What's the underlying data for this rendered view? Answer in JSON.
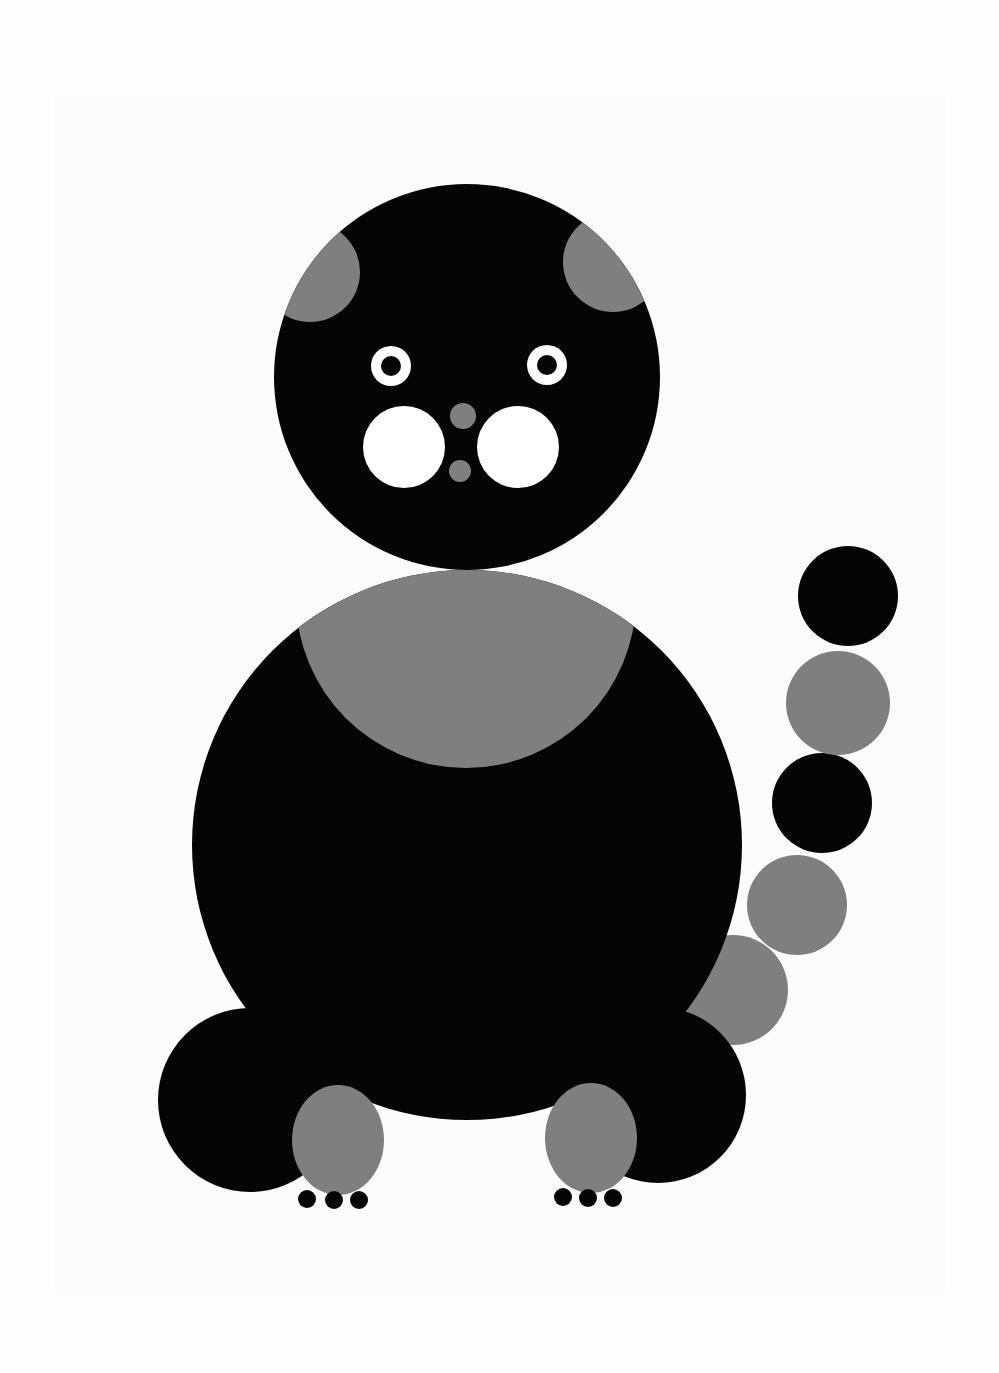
{
  "artwork": {
    "subject": "Geometric cat illustration built from circles",
    "colors": {
      "background": "#fdfdfd",
      "card": "#fbfbfb",
      "black": "#050505",
      "gray": "#7f7f7f",
      "white": "#ffffff"
    },
    "head": {
      "cx": 467,
      "cy": 377,
      "r": 193
    },
    "ears": [
      {
        "cx": 310,
        "cy": 272,
        "r": 50
      },
      {
        "cx": 613,
        "cy": 262,
        "r": 50
      }
    ],
    "eyes": [
      {
        "cx": 391,
        "cy": 366,
        "r_outer": 20,
        "r_inner": 10
      },
      {
        "cx": 547,
        "cy": 365,
        "r_outer": 20,
        "r_inner": 10
      }
    ],
    "cheeks": [
      {
        "cx": 404,
        "cy": 447,
        "r": 41
      },
      {
        "cx": 518,
        "cy": 447,
        "r": 41
      }
    ],
    "nose": [
      {
        "cx": 463,
        "cy": 416,
        "r": 13
      },
      {
        "cx": 460,
        "cy": 471,
        "r": 11
      }
    ],
    "body": {
      "cx": 467,
      "cy": 845,
      "r": 275
    },
    "chest": {
      "cx": 466,
      "cy": 598,
      "r": 170
    },
    "tail": [
      {
        "cx": 733,
        "cy": 990,
        "r": 55,
        "color": "gray"
      },
      {
        "cx": 797,
        "cy": 905,
        "r": 50,
        "color": "gray"
      },
      {
        "cx": 822,
        "cy": 803,
        "r": 50,
        "color": "black"
      },
      {
        "cx": 838,
        "cy": 703,
        "r": 52,
        "color": "gray"
      },
      {
        "cx": 848,
        "cy": 596,
        "r": 50,
        "color": "black"
      }
    ],
    "haunches": [
      {
        "cx": 250,
        "cy": 1100,
        "r": 92
      },
      {
        "cx": 658,
        "cy": 1095,
        "r": 88
      }
    ],
    "feet": [
      {
        "cx": 338,
        "cy": 1140,
        "rx": 46,
        "ry": 55
      },
      {
        "cx": 591,
        "cy": 1138,
        "rx": 46,
        "ry": 55
      }
    ],
    "toes": [
      {
        "cx": 307,
        "cy": 1199,
        "r": 9
      },
      {
        "cx": 334,
        "cy": 1200,
        "r": 9
      },
      {
        "cx": 359,
        "cy": 1200,
        "r": 9
      },
      {
        "cx": 563,
        "cy": 1197,
        "r": 9
      },
      {
        "cx": 588,
        "cy": 1198,
        "r": 9
      },
      {
        "cx": 613,
        "cy": 1198,
        "r": 9
      }
    ]
  }
}
